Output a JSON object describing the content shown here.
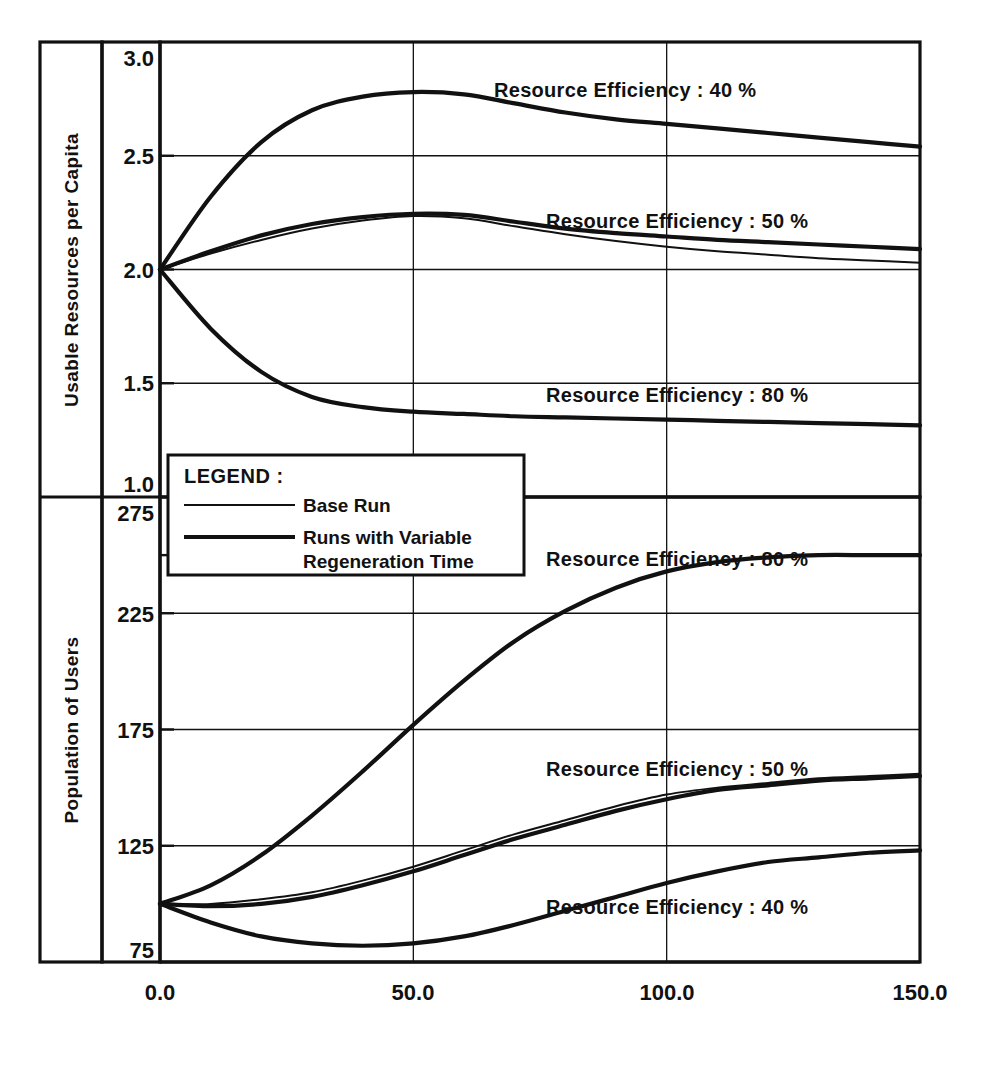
{
  "figure": {
    "background_color": "#ffffff",
    "ink_color": "#111111"
  },
  "panels": {
    "top": {
      "y_axis_title": "Usable Resources per Capita",
      "y_ticks": [
        "3.0",
        "2.5",
        "2.0",
        "1.5",
        "1.0"
      ],
      "annotations": [
        "Resource Efficiency : 40 %",
        "Resource Efficiency : 50 %",
        "Resource Efficiency : 80 %"
      ]
    },
    "bottom": {
      "y_axis_title": "Population of Users",
      "y_ticks": [
        "275",
        "225",
        "175",
        "125",
        "75"
      ],
      "annotations": [
        "Resource Efficiency : 80 %",
        "Resource Efficiency : 50 %",
        "Resource Efficiency : 40 %"
      ]
    }
  },
  "x_axis": {
    "ticks": [
      "0.0",
      "50.0",
      "100.0",
      "150.0"
    ]
  },
  "legend": {
    "title": "LEGEND :",
    "items": [
      {
        "label": "Base Run",
        "style": "thin"
      },
      {
        "label": "Runs with Variable\nRegeneration Time",
        "style": "thick",
        "line1": "Runs with Variable",
        "line2": "Regeneration Time"
      }
    ]
  },
  "chart_data": {
    "type": "line",
    "title": "",
    "xlabel": "",
    "panels": [
      {
        "name": "top",
        "ylabel": "Usable Resources per Capita",
        "ylim": [
          1.0,
          3.0
        ],
        "yticks": [
          1.0,
          1.5,
          2.0,
          2.5,
          3.0
        ],
        "xlim": [
          0.0,
          150.0
        ],
        "xticks": [
          0.0,
          50.0,
          100.0,
          150.0
        ],
        "grid": true,
        "x": [
          0,
          10,
          20,
          30,
          40,
          50,
          60,
          70,
          80,
          90,
          100,
          110,
          120,
          130,
          140,
          150
        ],
        "series": [
          {
            "name": "Resource Efficiency : 40 % (Runs with Variable Regeneration Time)",
            "style": "thick",
            "annotation": "Resource Efficiency : 40 %",
            "values": [
              2.0,
              2.32,
              2.56,
              2.7,
              2.76,
              2.78,
              2.77,
              2.73,
              2.69,
              2.66,
              2.64,
              2.62,
              2.6,
              2.58,
              2.56,
              2.54
            ]
          },
          {
            "name": "Resource Efficiency : 50 % (Runs with Variable Regeneration Time)",
            "style": "thick",
            "annotation": "Resource Efficiency : 50 %",
            "values": [
              2.0,
              2.08,
              2.15,
              2.2,
              2.23,
              2.245,
              2.24,
              2.21,
              2.18,
              2.16,
              2.145,
              2.13,
              2.12,
              2.11,
              2.1,
              2.09
            ]
          },
          {
            "name": "Base Run (50 %)",
            "style": "thin",
            "annotation": "",
            "values": [
              2.0,
              2.07,
              2.13,
              2.18,
              2.215,
              2.235,
              2.225,
              2.19,
              2.155,
              2.125,
              2.1,
              2.08,
              2.065,
              2.05,
              2.04,
              2.03
            ]
          },
          {
            "name": "Resource Efficiency : 80 % (Runs with Variable Regeneration Time)",
            "style": "thick",
            "annotation": "Resource Efficiency : 80 %",
            "values": [
              2.0,
              1.74,
              1.55,
              1.44,
              1.395,
              1.375,
              1.365,
              1.355,
              1.35,
              1.345,
              1.34,
              1.335,
              1.33,
              1.325,
              1.32,
              1.315
            ]
          }
        ]
      },
      {
        "name": "bottom",
        "ylabel": "Population of Users",
        "ylim": [
          75,
          275
        ],
        "yticks": [
          75,
          125,
          175,
          225,
          275
        ],
        "xlim": [
          0.0,
          150.0
        ],
        "xticks": [
          0.0,
          50.0,
          100.0,
          150.0
        ],
        "grid": true,
        "x": [
          0,
          10,
          20,
          30,
          40,
          50,
          60,
          70,
          80,
          90,
          100,
          110,
          120,
          130,
          140,
          150
        ],
        "series": [
          {
            "name": "Resource Efficiency : 80 % (Runs with Variable Regeneration Time)",
            "style": "thick",
            "annotation": "Resource Efficiency : 80 %",
            "values": [
              100,
              108,
              121,
              138,
              157,
              177,
              196,
              213,
              226,
              236,
              243,
              247,
              249,
              250,
              250,
              250
            ]
          },
          {
            "name": "Resource Efficiency : 50 % (Runs with Variable Regeneration Time)",
            "style": "thick",
            "annotation": "Resource Efficiency : 50 %",
            "values": [
              100,
              99,
              100,
              103,
              108,
              114,
              121,
              128,
              134,
              140,
              145,
              149,
              151,
              153,
              154,
              155
            ]
          },
          {
            "name": "Base Run (50 %)",
            "style": "thin",
            "annotation": "",
            "values": [
              100,
              100,
              102,
              105,
              110,
              116,
              123,
              130,
              136,
              142,
              147,
              150,
              152,
              154,
              155,
              156
            ]
          },
          {
            "name": "Resource Efficiency : 40 % (Runs with Variable Regeneration Time)",
            "style": "thick",
            "annotation": "Resource Efficiency : 40 %",
            "values": [
              100,
              92,
              86,
              83,
              82,
              83,
              86,
              91,
              97,
              103,
              109,
              114,
              118,
              120,
              122,
              123
            ]
          }
        ]
      }
    ]
  }
}
